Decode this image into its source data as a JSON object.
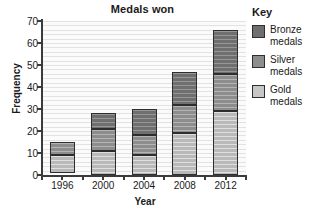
{
  "chart_data": {
    "type": "bar",
    "subtype": "stacked-vertical",
    "title": "Medals won",
    "xlabel": "Year",
    "ylabel": "Frequency",
    "categories": [
      "1996",
      "2000",
      "2004",
      "2008",
      "2012"
    ],
    "ylim": [
      0,
      70
    ],
    "yticks": [
      0,
      10,
      20,
      30,
      40,
      50,
      60,
      70
    ],
    "ytick_labels": [
      "0",
      "10",
      "20",
      "30",
      "40",
      "50",
      "60",
      "70"
    ],
    "grid": "horizontal",
    "legend_position": "right",
    "legend_title": "Key",
    "stack_order_bottom_to_top": [
      "Gold medals",
      "Silver medals",
      "Bronze medals"
    ],
    "series": [
      {
        "name": "Gold medals",
        "legend_label": "Gold\nmedals",
        "color": "#c6c6c6",
        "values": [
          8,
          11,
          9,
          19,
          29
        ],
        "cumulative_tops": [
          9,
          11,
          9,
          19,
          29
        ],
        "baselines": [
          1,
          0,
          0,
          0,
          0
        ]
      },
      {
        "name": "Silver medals",
        "legend_label": "Silver\nmedals",
        "color": "#8d8d8d",
        "values": [
          6,
          10,
          9,
          13,
          17
        ],
        "cumulative_tops": [
          15,
          21,
          18,
          32,
          46
        ]
      },
      {
        "name": "Bronze medals",
        "legend_label": "Bronze\nmedals",
        "color": "#6f6f6f",
        "values": [
          0,
          7,
          12,
          15,
          20
        ],
        "cumulative_tops": [
          15,
          28,
          30,
          47,
          66
        ]
      }
    ],
    "totals": [
      15,
      28,
      30,
      47,
      66
    ]
  }
}
